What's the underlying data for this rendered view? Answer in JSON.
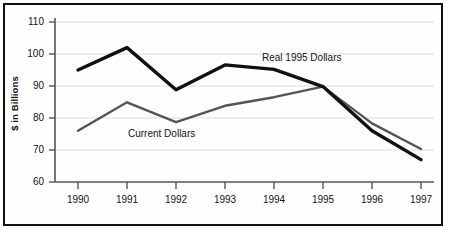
{
  "chart_data": {
    "type": "line",
    "title": "",
    "xlabel": "",
    "ylabel": "$ in Billions",
    "categories": [
      "1990",
      "1991",
      "1992",
      "1993",
      "1994",
      "1995",
      "1996",
      "1997"
    ],
    "ylim": [
      60,
      110
    ],
    "yticks": [
      "60",
      "70",
      "80",
      "90",
      "100",
      "110"
    ],
    "grid": "horizontal",
    "legend_position": "inline-annotations",
    "series": [
      {
        "name": "Real 1995 Dollars",
        "color": "#111111",
        "width": 3.4,
        "values": [
          95.0,
          102.0,
          88.8,
          96.6,
          95.2,
          89.8,
          76.0,
          67.0
        ]
      },
      {
        "name": "Current Dollars",
        "color": "#555555",
        "width": 2.4,
        "values": [
          76.0,
          84.9,
          78.7,
          83.8,
          86.5,
          89.8,
          78.3,
          70.3
        ]
      }
    ],
    "annotations": [
      {
        "text": "Real 1995 Dollars",
        "series": "Real 1995 Dollars"
      },
      {
        "text": "Current Dollars",
        "series": "Current Dollars"
      }
    ]
  },
  "axis": {
    "y_title": "$ in Billions",
    "y_ticks": [
      "110",
      "100",
      "90",
      "80",
      "70",
      "60"
    ],
    "x_ticks": [
      "1990",
      "1991",
      "1992",
      "1993",
      "1994",
      "1995",
      "1996",
      "1997"
    ]
  },
  "labels": {
    "real": "Real 1995 Dollars",
    "current": "Current Dollars"
  },
  "colors": {
    "real_series": "#111111",
    "current_series": "#555555",
    "grid": "#d8d8d8",
    "axis": "#555555",
    "border": "#111111",
    "text": "#141414"
  }
}
